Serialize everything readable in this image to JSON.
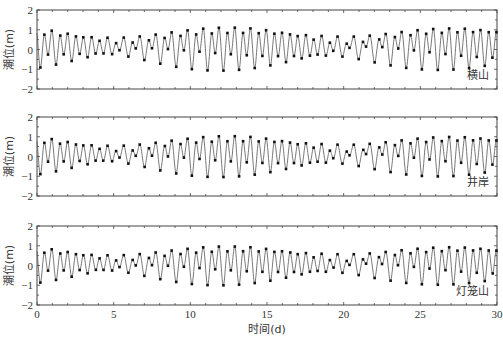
{
  "chart_data": {
    "type": "line",
    "title": "",
    "xlabel": "时间(d)",
    "ylabel": "潮位(m)",
    "xlim": [
      0,
      30
    ],
    "ylim": [
      -2,
      2
    ],
    "x_ticks": [
      0,
      5,
      10,
      15,
      20,
      25,
      30
    ],
    "x_minor_step": 1,
    "y_ticks": [
      -2,
      -1,
      0,
      1,
      2
    ],
    "y_minor_step": 0.5,
    "grid": false,
    "legend": "none",
    "series_style": {
      "simulated": "thin grey line",
      "observed": "black square markers at high/low tides"
    },
    "panels": [
      {
        "station": "横山",
        "description": "Mixed semi-diurnal tide, ~2 cycles/day; peaks reach ~1.4 m near days 7-10 and 20-23 (spring), ~0.6 m near days 0-2, 13-16 and 28-30 (neap); lows down to ~-0.7 m",
        "mean": 0.15,
        "constituents": {
          "m2_amp": 0.55,
          "s2_amp": 0.25,
          "k1_amp": 0.28,
          "o1_amp": 0.2
        },
        "approx_high_tide_envelope": [
          [
            0,
            0.55
          ],
          [
            3,
            0.75
          ],
          [
            6,
            1.1
          ],
          [
            8.5,
            1.4
          ],
          [
            11,
            1.1
          ],
          [
            14,
            0.6
          ],
          [
            16,
            0.8
          ],
          [
            19,
            1.2
          ],
          [
            22,
            1.45
          ],
          [
            25,
            1.05
          ],
          [
            28,
            0.7
          ],
          [
            30,
            0.75
          ]
        ],
        "approx_low_tide_envelope": [
          [
            0,
            -0.3
          ],
          [
            5,
            -0.55
          ],
          [
            9,
            -0.7
          ],
          [
            14,
            -0.3
          ],
          [
            22,
            -0.7
          ],
          [
            30,
            -0.35
          ]
        ]
      },
      {
        "station": "井岸",
        "description": "Similar to 横山, peaks ~1.3-1.4 m at spring tides, lows ~-0.7 m",
        "mean": 0.12,
        "constituents": {
          "m2_amp": 0.52,
          "s2_amp": 0.24,
          "k1_amp": 0.27,
          "o1_amp": 0.19
        },
        "approx_high_tide_envelope": [
          [
            0,
            0.5
          ],
          [
            3,
            0.7
          ],
          [
            6,
            1.05
          ],
          [
            8.5,
            1.3
          ],
          [
            11,
            1.1
          ],
          [
            14,
            0.6
          ],
          [
            16,
            0.75
          ],
          [
            19,
            1.15
          ],
          [
            22,
            1.4
          ],
          [
            25,
            1.0
          ],
          [
            28,
            0.65
          ],
          [
            30,
            0.7
          ]
        ],
        "approx_low_tide_envelope": [
          [
            0,
            -0.3
          ],
          [
            5,
            -0.55
          ],
          [
            9,
            -0.7
          ],
          [
            14,
            -0.3
          ],
          [
            22,
            -0.7
          ],
          [
            30,
            -0.35
          ]
        ]
      },
      {
        "station": "灯笼山",
        "description": "Slightly smaller amplitude; peaks ~1.2-1.3 m at spring tides, lows ~-0.6 m",
        "mean": 0.1,
        "constituents": {
          "m2_amp": 0.5,
          "s2_amp": 0.22,
          "k1_amp": 0.26,
          "o1_amp": 0.18
        },
        "approx_high_tide_envelope": [
          [
            0,
            0.45
          ],
          [
            3,
            0.65
          ],
          [
            6,
            1.0
          ],
          [
            8.5,
            1.25
          ],
          [
            11,
            1.05
          ],
          [
            14,
            0.55
          ],
          [
            16,
            0.7
          ],
          [
            19,
            1.1
          ],
          [
            22,
            1.3
          ],
          [
            25,
            0.95
          ],
          [
            28,
            0.6
          ],
          [
            30,
            0.65
          ]
        ],
        "approx_low_tide_envelope": [
          [
            0,
            -0.25
          ],
          [
            5,
            -0.5
          ],
          [
            9,
            -0.6
          ],
          [
            14,
            -0.25
          ],
          [
            22,
            -0.6
          ],
          [
            30,
            -0.3
          ]
        ]
      }
    ]
  },
  "layout": {
    "plot_left": 37,
    "plot_right": 497,
    "panel_tops": [
      10,
      117,
      226
    ],
    "panel_bottoms": [
      89,
      196,
      305
    ]
  },
  "colors": {
    "line": "#555555",
    "marker": "#111111",
    "frame": "#444444",
    "text": "#333333"
  }
}
